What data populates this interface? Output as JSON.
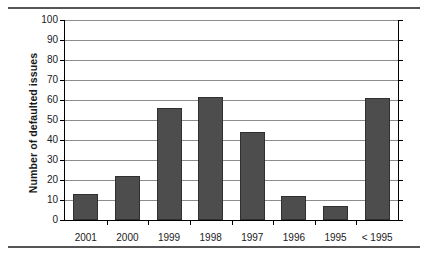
{
  "chart_data": {
    "type": "bar",
    "title": "",
    "subtitle": "",
    "xlabel": "",
    "ylabel": "Number of defaulted issues",
    "categories": [
      "2001",
      "2000",
      "1999",
      "1998",
      "1997",
      "1996",
      "1995",
      "< 1995"
    ],
    "values": [
      13,
      22,
      56,
      61.5,
      44,
      12,
      7,
      61
    ],
    "series": [
      {
        "name": "Number of defaulted issues",
        "values": [
          13,
          22,
          56,
          61.5,
          44,
          12,
          7,
          61
        ]
      }
    ],
    "ylim": [
      0,
      100
    ],
    "ytick_step": 10,
    "ytick_labels": [
      "0",
      "10",
      "20",
      "30",
      "40",
      "50",
      "60",
      "70",
      "80",
      "90",
      "100"
    ],
    "grid": "horizontal",
    "legend": "none",
    "bar_color": "#4d4d4d",
    "bar_edge_color": "#303030",
    "gridline_color": "#8d8d8d",
    "axis_color": "#000000",
    "background_color": "#ffffff",
    "annotations": []
  },
  "figure": {
    "rule_top": "",
    "rule_bottom": ""
  }
}
